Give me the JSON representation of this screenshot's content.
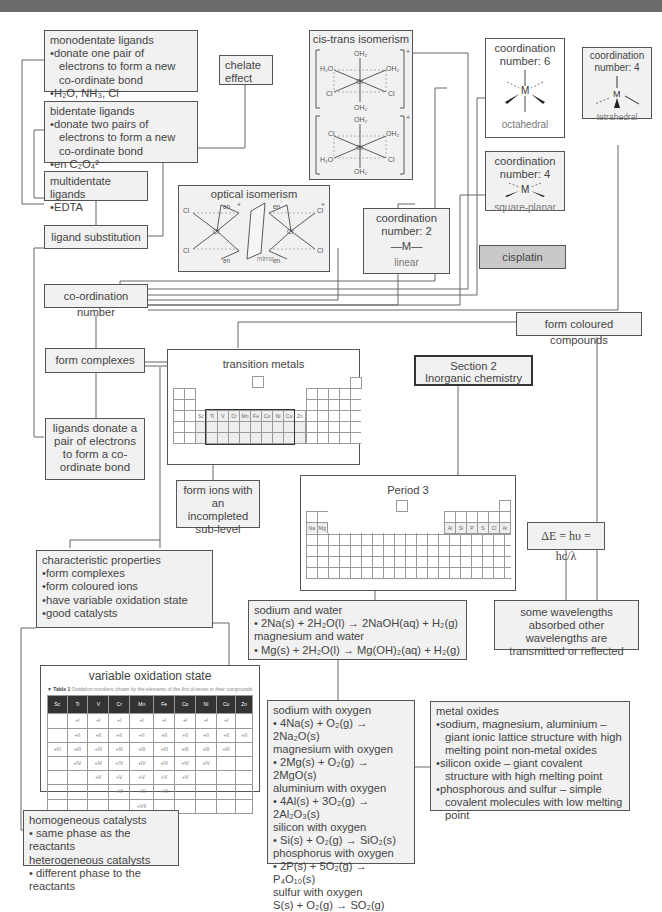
{
  "header": {
    "bar_color": "#6b6b6b"
  },
  "nodes": {
    "monodentate": {
      "title": "monodentate ligands",
      "points": [
        "donate one pair of electrons to form a new co-ordinate bond",
        "H₂O, NH₃, Cl⁻"
      ]
    },
    "bidentate": {
      "title": "bidentate ligands",
      "points": [
        "donate two pairs of electrons to form a new co-ordinate bond",
        "en C₂O₄²⁻"
      ]
    },
    "multidentate": {
      "title": "multidentate ligands",
      "points": [
        "EDTA"
      ]
    },
    "chelate": {
      "label": "chelate effect"
    },
    "ligand_substitution": {
      "label": "ligand substitution"
    },
    "cis_trans": {
      "title": "cis-trans isomerism",
      "ligands_top": [
        "OH₂",
        "H₂O",
        "OH₂",
        "Cl",
        "Cl",
        "OH₂"
      ],
      "ligands_bottom": [
        "OH₂",
        "Cl",
        "OH₂",
        "H₂O",
        "Cl",
        "OH₂"
      ],
      "metal": "Cr",
      "charge": "+"
    },
    "optical": {
      "title": "optical isomerism",
      "metal": "Cr",
      "ligand": "en",
      "chloride": "Cl",
      "mirror_label": "mirror",
      "charge": "+"
    },
    "coord6": {
      "line1": "coordination",
      "line2": "number: 6",
      "metal": "M",
      "shape": "octahedral"
    },
    "coord4_sq": {
      "line1": "coordination",
      "line2": "number: 4",
      "metal": "M",
      "shape": "square-planar"
    },
    "coord4_tet": {
      "line1": "coordination",
      "line2": "number: 4",
      "metal": "M",
      "shape": "tetrahedral"
    },
    "coord2": {
      "line1": "coordination",
      "line2": "number: 2",
      "metal": "—M—",
      "shape": "linear"
    },
    "cisplatin": {
      "label": "cisplatin"
    },
    "coordination_number": {
      "label": "co-ordination number"
    },
    "form_coloured": {
      "label": "form coloured compounds"
    },
    "form_complexes": {
      "label": "form complexes"
    },
    "ligands_donate": {
      "label": "ligands donate a pair of electrons to form a co-ordinate bond"
    },
    "transition_metals": {
      "title": "transition metals",
      "elements": [
        "Sc",
        "Ti",
        "V",
        "Cr",
        "Mn",
        "Fe",
        "Co",
        "Ni",
        "Cu",
        "Zn"
      ]
    },
    "section": {
      "line1": "Section 2",
      "line2": "Inorganic chemistry"
    },
    "form_ions": {
      "label": "form ions with an incompleted sub-level"
    },
    "period3": {
      "title": "Period 3",
      "elements_left": [
        "Na",
        "Mg"
      ],
      "elements_right": [
        "Al",
        "Si",
        "P",
        "S",
        "Cl",
        "Ar"
      ]
    },
    "energy": {
      "formula": "ΔE = hυ = hc/λ"
    },
    "characteristic": {
      "title": "characteristic properties",
      "points": [
        "form complexes",
        "form coloured ions",
        "have variable oxidation state",
        "good catalysts"
      ]
    },
    "sodium_water": {
      "lines": [
        "sodium and water",
        "• 2Na(s) + 2H₂O(l) → 2NaOH(aq) + H₂(g)",
        "magnesium and water",
        "• Mg(s) + 2H₂O(l) → Mg(OH)₂(aq) + H₂(g)"
      ]
    },
    "wavelengths": {
      "label": "some wavelengths absorbed other wavelengths are transmitted or reflected"
    },
    "variable_ox": {
      "title": "variable oxidation state",
      "caption_label": "▼ Table 1",
      "caption": "Oxidation numbers shown by the elements of the first d-series in their compounds",
      "headers": [
        "Sc",
        "Ti",
        "V",
        "Cr",
        "Mn",
        "Fe",
        "Co",
        "Ni",
        "Cu",
        "Zn"
      ],
      "rows": [
        [
          "",
          "+I",
          "+I",
          "+I",
          "+I",
          "+I",
          "+I",
          "+I",
          "+I",
          ""
        ],
        [
          "",
          "+II",
          "+II",
          "+II",
          "+II",
          "+II",
          "+II",
          "+II",
          "+II",
          "+II"
        ],
        [
          "+III",
          "+III",
          "+III",
          "+III",
          "+III",
          "+III",
          "+III",
          "+III",
          "+III",
          ""
        ],
        [
          "",
          "+IV",
          "+IV",
          "+IV",
          "+IV",
          "+IV",
          "+IV",
          "+IV",
          "",
          ""
        ],
        [
          "",
          "",
          "+V",
          "+V",
          "+V",
          "+V",
          "+V",
          "",
          "",
          ""
        ],
        [
          "",
          "",
          "",
          "+VI",
          "+VI",
          "+VI",
          "",
          "",
          "",
          ""
        ],
        [
          "",
          "",
          "",
          "",
          "+VII",
          "",
          "",
          "",
          "",
          ""
        ]
      ]
    },
    "catalysts": {
      "lines": [
        "homogeneous catalysts",
        "• same phase as the reactants",
        "heterogeneous catalysts",
        "• different phase to the reactants"
      ]
    },
    "oxygen": {
      "lines": [
        "sodium with oxygen",
        "• 4Na(s) + O₂(g) → 2Na₂O(s)",
        "magnesium with oxygen",
        "• 2Mg(s) + O₂(g) → 2MgO(s)",
        "aluminium with oxygen",
        "• 4Al(s) + 3O₂(g) → 2Al₂O₃(s)",
        "silicon with oxygen",
        "• Si(s) + O₂(g) → SiO₂(s)",
        "phosphorus with oxygen",
        "• 2P(s) + 5O₂(g) → P₄O₁₀(s)",
        "sulfur with oxygen",
        "S(s) + O₂(g) → SO₂(g)"
      ]
    },
    "metal_oxides": {
      "title": "metal oxides",
      "points": [
        "sodium, magnesium, aluminium – giant ionic lattice structure with high melting point non-metal oxides",
        "silicon oxide – giant covalent structure with high melting point",
        "phosphorous and sulfur – simple covalent molecules with low melting point"
      ]
    }
  }
}
